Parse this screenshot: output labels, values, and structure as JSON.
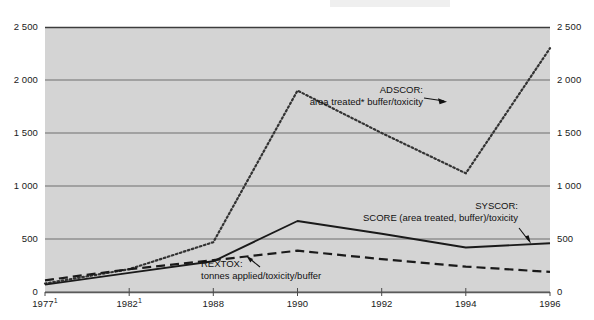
{
  "chart_data": {
    "type": "line",
    "title": "",
    "subtitle": "",
    "xlabel": "",
    "ylabel": "",
    "categories": [
      "1977¹",
      "1982¹",
      "1988",
      "1990",
      "1992",
      "1994",
      "1996"
    ],
    "ylim": [
      0,
      2500
    ],
    "yticks": [
      0,
      500,
      1000,
      1500,
      2000,
      2500
    ],
    "ytick_labels": [
      "0",
      "500",
      "1 000",
      "1 500",
      "2 000",
      "2 500"
    ],
    "grid": true,
    "grid_axis": "y",
    "legend_position": "inline-annotations",
    "dual_y_axis": true,
    "series": [
      {
        "name": "ADSCOR",
        "label": "ADSCOR:",
        "sublabel": "area treated* buffer/toxicity",
        "style": "dotted",
        "color": "#333333",
        "values": [
          80,
          215,
          470,
          1900,
          1500,
          1120,
          2300
        ]
      },
      {
        "name": "SYSCOR",
        "label": "SYSCOR:",
        "sublabel": "SCORE (area treated, buffer)/toxicity",
        "style": "solid",
        "color": "#1a1a1a",
        "values": [
          70,
          180,
          290,
          670,
          550,
          420,
          460
        ]
      },
      {
        "name": "REXTOX",
        "label": "REXTOX:",
        "sublabel": "tonnes applied/toxicity/buffer",
        "style": "dashed",
        "color": "#1a1a1a",
        "values": [
          110,
          215,
          300,
          390,
          310,
          240,
          190
        ]
      }
    ]
  },
  "axes": {
    "y_left_labels": [
      "2 500",
      "2 000",
      "1 500",
      "1 000",
      "500",
      "0"
    ],
    "y_right_labels": [
      "2 500",
      "2 000",
      "1 500",
      "1 000",
      "500",
      "0"
    ],
    "x_labels": [
      {
        "text": "1977",
        "sup": "1"
      },
      {
        "text": "1982",
        "sup": "1"
      },
      {
        "text": "1988",
        "sup": ""
      },
      {
        "text": "1990",
        "sup": ""
      },
      {
        "text": "1992",
        "sup": ""
      },
      {
        "text": "1994",
        "sup": ""
      },
      {
        "text": "1996",
        "sup": ""
      }
    ]
  },
  "annotations": [
    {
      "id": "adscor",
      "title": "ADSCOR:",
      "detail": "area treated* buffer/toxicity"
    },
    {
      "id": "syscor",
      "title": "SYSCOR:",
      "detail": "SCORE (area treated, buffer)/toxicity"
    },
    {
      "id": "rextox",
      "title": "REXTOX:",
      "detail": "tonnes applied/toxicity/buffer"
    }
  ],
  "colors": {
    "plot_background": "#d4d4d4",
    "gridline": "#6e6e6e",
    "axis": "#3c3c3c",
    "text": "#1a1a1a",
    "page_background": "#ffffff"
  }
}
